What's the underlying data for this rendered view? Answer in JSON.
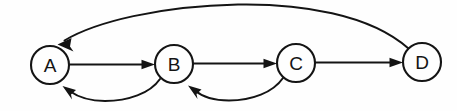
{
  "diagram": {
    "type": "directed-graph",
    "background_color": "#fefefe",
    "stroke_color": "#141414",
    "canvas": {
      "width": 457,
      "height": 111
    },
    "nodes": [
      {
        "id": "A",
        "label": "A",
        "cx": 50,
        "cy": 65,
        "r": 19
      },
      {
        "id": "B",
        "label": "B",
        "cx": 174,
        "cy": 64,
        "r": 19
      },
      {
        "id": "C",
        "label": "C",
        "cx": 296,
        "cy": 63,
        "r": 19
      },
      {
        "id": "D",
        "label": "D",
        "cx": 422,
        "cy": 62,
        "r": 19
      }
    ],
    "edges": [
      {
        "id": "A-B",
        "from": "A",
        "to": "B",
        "shape": "straight",
        "direction": "right"
      },
      {
        "id": "B-C",
        "from": "B",
        "to": "C",
        "shape": "straight",
        "direction": "right"
      },
      {
        "id": "C-D",
        "from": "C",
        "to": "D",
        "shape": "straight",
        "direction": "right"
      },
      {
        "id": "D-A",
        "from": "D",
        "to": "A",
        "shape": "arc-above",
        "direction": "left"
      },
      {
        "id": "B-A",
        "from": "B",
        "to": "A",
        "shape": "arc-below",
        "direction": "left"
      },
      {
        "id": "C-B",
        "from": "C",
        "to": "B",
        "shape": "arc-below",
        "direction": "left"
      }
    ]
  }
}
